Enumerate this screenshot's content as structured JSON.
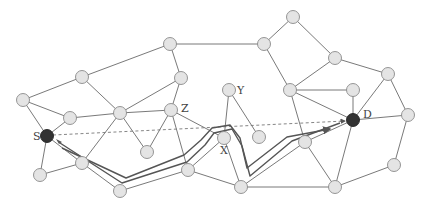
{
  "diagram": {
    "type": "network-graph",
    "labels": {
      "source": "S",
      "destination": "D",
      "x": "X",
      "y": "Y",
      "z": "Z"
    },
    "colors": {
      "node_fill": "#e4e4e4",
      "node_stroke": "#8a8a8a",
      "endpoint_fill": "#333333",
      "edge": "#6a6a6a",
      "route": "#555555"
    },
    "nodes": [
      {
        "id": "n1",
        "x": 170,
        "y": 44
      },
      {
        "id": "n2",
        "x": 82,
        "y": 77
      },
      {
        "id": "n3",
        "x": 23,
        "y": 100
      },
      {
        "id": "n4",
        "x": 70,
        "y": 118
      },
      {
        "id": "S",
        "x": 47,
        "y": 136,
        "label": "S",
        "dark": true
      },
      {
        "id": "n5",
        "x": 181,
        "y": 78
      },
      {
        "id": "n6",
        "x": 120,
        "y": 113
      },
      {
        "id": "Z",
        "x": 171,
        "y": 110,
        "label": "Z"
      },
      {
        "id": "n7",
        "x": 147,
        "y": 152
      },
      {
        "id": "n8",
        "x": 40,
        "y": 175
      },
      {
        "id": "n9",
        "x": 82,
        "y": 163
      },
      {
        "id": "n10",
        "x": 120,
        "y": 191
      },
      {
        "id": "n11",
        "x": 188,
        "y": 170
      },
      {
        "id": "X",
        "x": 224,
        "y": 138,
        "label": "X"
      },
      {
        "id": "Y",
        "x": 229,
        "y": 90,
        "label": "Y"
      },
      {
        "id": "n12",
        "x": 259,
        "y": 137
      },
      {
        "id": "n13",
        "x": 241,
        "y": 187
      },
      {
        "id": "n14",
        "x": 293,
        "y": 17
      },
      {
        "id": "n15",
        "x": 264,
        "y": 44
      },
      {
        "id": "n16",
        "x": 335,
        "y": 58
      },
      {
        "id": "n17",
        "x": 388,
        "y": 74
      },
      {
        "id": "n18",
        "x": 290,
        "y": 90
      },
      {
        "id": "n19",
        "x": 353,
        "y": 90
      },
      {
        "id": "D",
        "x": 353,
        "y": 120,
        "label": "D",
        "dark": true
      },
      {
        "id": "n20",
        "x": 408,
        "y": 115
      },
      {
        "id": "n21",
        "x": 305,
        "y": 142
      },
      {
        "id": "n22",
        "x": 394,
        "y": 165
      },
      {
        "id": "n23",
        "x": 335,
        "y": 187
      }
    ],
    "edges": [
      [
        "n2",
        "n1"
      ],
      [
        "n1",
        "n15"
      ],
      [
        "n1",
        "n5"
      ],
      [
        "n3",
        "n2"
      ],
      [
        "n2",
        "n6"
      ],
      [
        "n5",
        "n6"
      ],
      [
        "n5",
        "Z"
      ],
      [
        "n3",
        "S"
      ],
      [
        "n3",
        "n4"
      ],
      [
        "n4",
        "S"
      ],
      [
        "n4",
        "n6"
      ],
      [
        "n6",
        "Z"
      ],
      [
        "n6",
        "n7"
      ],
      [
        "n7",
        "Z"
      ],
      [
        "n6",
        "n9"
      ],
      [
        "S",
        "n8"
      ],
      [
        "S",
        "n9"
      ],
      [
        "n8",
        "n9"
      ],
      [
        "n9",
        "n10"
      ],
      [
        "n10",
        "n11"
      ],
      [
        "Z",
        "X"
      ],
      [
        "Z",
        "n11"
      ],
      [
        "n11",
        "X"
      ],
      [
        "n11",
        "n13"
      ],
      [
        "X",
        "n13"
      ],
      [
        "X",
        "Y"
      ],
      [
        "Y",
        "n12"
      ],
      [
        "n13",
        "n23"
      ],
      [
        "n15",
        "n14"
      ],
      [
        "n14",
        "n16"
      ],
      [
        "n15",
        "n18"
      ],
      [
        "n16",
        "n18"
      ],
      [
        "n16",
        "n17"
      ],
      [
        "n18",
        "n19"
      ],
      [
        "n18",
        "D"
      ],
      [
        "n18",
        "n21"
      ],
      [
        "n19",
        "D"
      ],
      [
        "n17",
        "D"
      ],
      [
        "n17",
        "n20"
      ],
      [
        "D",
        "n20"
      ],
      [
        "D",
        "n21"
      ],
      [
        "D",
        "n23"
      ],
      [
        "n21",
        "n23"
      ],
      [
        "n21",
        "n13"
      ],
      [
        "n20",
        "n22"
      ],
      [
        "n22",
        "n23"
      ]
    ],
    "dashed_line": {
      "from": "S",
      "to": "D"
    },
    "route": {
      "outer": [
        [
          60,
          143
        ],
        [
          122,
          183
        ],
        [
          187,
          162
        ],
        [
          205,
          145
        ],
        [
          214,
          133
        ],
        [
          232,
          129
        ],
        [
          242,
          146
        ],
        [
          250,
          176
        ],
        [
          292,
          141
        ],
        [
          340,
          123
        ]
      ],
      "inner": [
        [
          62,
          148
        ],
        [
          126,
          178
        ],
        [
          184,
          155
        ],
        [
          201,
          140
        ],
        [
          212,
          128
        ],
        [
          230,
          125
        ],
        [
          240,
          138
        ],
        [
          247,
          168
        ],
        [
          287,
          137
        ],
        [
          330,
          129
        ]
      ],
      "arrow_at_D": [
        338,
        121
      ],
      "arrow_at_S": [
        60,
        143
      ]
    }
  }
}
